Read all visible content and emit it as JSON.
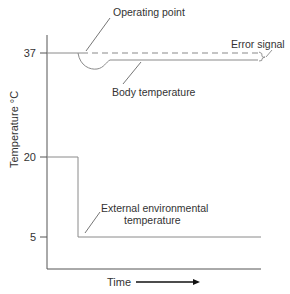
{
  "diagram": {
    "y_axis_label": "Temperature °C",
    "x_axis_label": "Time",
    "y_ticks": [
      {
        "label": "37",
        "value": 37
      },
      {
        "label": "20",
        "value": 20
      },
      {
        "label": "5",
        "value": 5
      }
    ],
    "annotations": {
      "operating_point": "Operating point",
      "error_signal": "Error signal",
      "body_temperature": "Body temperature",
      "external_line1": "External environmental",
      "external_line2": "temperature"
    },
    "colors": {
      "line": "#8a8a8a",
      "axis": "#555555",
      "text": "#333333",
      "arrow": "#111111"
    }
  }
}
